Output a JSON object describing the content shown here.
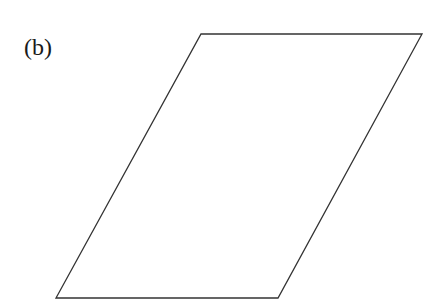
{
  "figure": {
    "label": "(b)",
    "shape": "parallelogram",
    "vertices": [
      [
        201,
        34
      ],
      [
        422,
        34
      ],
      [
        278,
        298
      ],
      [
        56,
        298
      ]
    ],
    "stroke_color": "#333333",
    "fill_color": "#ffffff"
  }
}
